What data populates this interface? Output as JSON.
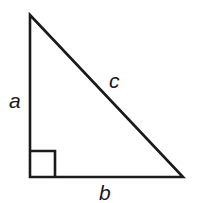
{
  "figure": {
    "kind": "right-triangle-diagram",
    "background_color": "#ffffff",
    "stroke_color": "#1a1a1a",
    "stroke_width": 2.6
  },
  "geometry": {
    "apex": {
      "x": 30,
      "y": 15
    },
    "bottom_left": {
      "x": 30,
      "y": 177
    },
    "bottom_right": {
      "x": 183,
      "y": 177
    },
    "right_angle_marker": {
      "x": 30,
      "y": 151,
      "width": 25,
      "height": 26
    }
  },
  "labels": {
    "vertical_leg": "a",
    "hypotenuse": "c",
    "horizontal_leg": "b"
  }
}
